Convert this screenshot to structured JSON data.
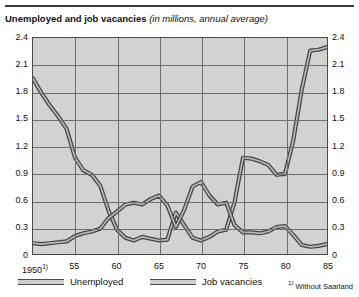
{
  "title": {
    "main": "Unemployed and job vacancies ",
    "sub": "(in millions, annual average)"
  },
  "legend": {
    "items": [
      {
        "label": "Unemployed",
        "color": "#4d4d4d"
      },
      {
        "label": "Job vacancies",
        "color": "#4d4d4d"
      }
    ]
  },
  "footnote": {
    "marker": "1)",
    "text": " Without Saarland"
  },
  "chart_data": {
    "type": "line",
    "title": "Unemployed and job vacancies (in millions, annual average)",
    "xlabel": "",
    "ylabel": "",
    "unit": "millions",
    "grid": true,
    "legend_position": "bottom",
    "xlim": [
      1950,
      1985
    ],
    "ylim": [
      0,
      2.4
    ],
    "ytick_labels": [
      "0",
      "0.3",
      "0.6",
      "0.9",
      "1.2",
      "1.5",
      "1.8",
      "2.1",
      "2.4"
    ],
    "ytick_values": [
      0,
      0.3,
      0.6,
      0.9,
      1.2,
      1.5,
      1.8,
      2.1,
      2.4
    ],
    "xtick_labels": [
      "1950",
      "55",
      "60",
      "65",
      "70",
      "75",
      "80",
      "85"
    ],
    "xtick_values": [
      1950,
      1955,
      1960,
      1965,
      1970,
      1975,
      1980,
      1985
    ],
    "x": [
      1950,
      1951,
      1952,
      1953,
      1954,
      1955,
      1956,
      1957,
      1958,
      1959,
      1960,
      1961,
      1962,
      1963,
      1964,
      1965,
      1966,
      1967,
      1968,
      1969,
      1970,
      1971,
      1972,
      1973,
      1974,
      1975,
      1976,
      1977,
      1978,
      1979,
      1980,
      1981,
      1982,
      1983,
      1984,
      1985
    ],
    "series": [
      {
        "name": "Unemployed",
        "values": [
          1.95,
          1.79,
          1.65,
          1.53,
          1.39,
          1.07,
          0.93,
          0.88,
          0.76,
          0.48,
          0.27,
          0.18,
          0.15,
          0.19,
          0.17,
          0.15,
          0.16,
          0.46,
          0.32,
          0.18,
          0.15,
          0.19,
          0.25,
          0.27,
          0.58,
          1.07,
          1.06,
          1.03,
          0.99,
          0.88,
          0.89,
          1.27,
          1.83,
          2.26,
          2.27,
          2.3
        ]
      },
      {
        "name": "Job vacancies",
        "values": [
          0.12,
          0.11,
          0.12,
          0.13,
          0.14,
          0.2,
          0.23,
          0.25,
          0.28,
          0.4,
          0.47,
          0.55,
          0.57,
          0.55,
          0.61,
          0.65,
          0.54,
          0.3,
          0.49,
          0.75,
          0.8,
          0.65,
          0.55,
          0.57,
          0.32,
          0.24,
          0.24,
          0.23,
          0.25,
          0.3,
          0.31,
          0.21,
          0.1,
          0.08,
          0.09,
          0.11
        ]
      }
    ],
    "annotations": [
      {
        "text": "1)",
        "at_x": 1950,
        "meaning": "Without Saarland"
      }
    ]
  }
}
